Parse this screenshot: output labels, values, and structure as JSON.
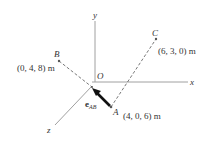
{
  "diagram": {
    "axes": {
      "x_label": "x",
      "y_label": "y",
      "z_label": "z",
      "origin_label": "O"
    },
    "points": {
      "A": {
        "label": "A",
        "coords": "(4, 0, 6) m"
      },
      "B": {
        "label": "B",
        "coords": "(0, 4, 8) m"
      },
      "C": {
        "label": "C",
        "coords": "(6, 3, 0) m"
      }
    },
    "vector": {
      "name": "e",
      "subscript": "AB"
    },
    "colors": {
      "axis": "#a0a0a0",
      "dashed": "#555555",
      "arrow": "#111111",
      "text": "#333333"
    }
  }
}
